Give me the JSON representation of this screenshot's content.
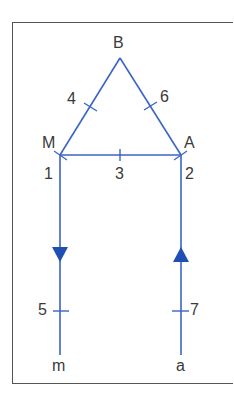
{
  "colors": {
    "line": "#3b64c4",
    "arrow": "#1f4fb5",
    "frame": "#555555",
    "text": "#3a3a3a"
  },
  "nodes": {
    "B": {
      "label": "B"
    },
    "M": {
      "label": "M"
    },
    "A": {
      "label": "A"
    },
    "m": {
      "label": "m"
    },
    "a": {
      "label": "a"
    }
  },
  "edges": [
    {
      "id": "1",
      "label": "1",
      "from": "M",
      "to": "m-line"
    },
    {
      "id": "2",
      "label": "2",
      "from": "A",
      "to": "a-line"
    },
    {
      "id": "3",
      "label": "3",
      "from": "M",
      "to": "A"
    },
    {
      "id": "4",
      "label": "4",
      "from": "M",
      "to": "B"
    },
    {
      "id": "5",
      "label": "5",
      "from": "M",
      "to": "m",
      "arrow": "down"
    },
    {
      "id": "6",
      "label": "6",
      "from": "B",
      "to": "A"
    },
    {
      "id": "7",
      "label": "7",
      "from": "a",
      "to": "A",
      "arrow": "up"
    }
  ]
}
